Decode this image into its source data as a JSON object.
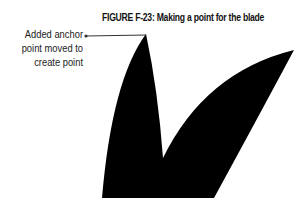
{
  "figure": {
    "label": "FIGURE F-23:",
    "title": "Making a point for the blade"
  },
  "callout": {
    "lines": [
      "Added anchor",
      "point moved to",
      "create point"
    ]
  },
  "colors": {
    "shape_fill": "#000000",
    "leader_line": "#333333",
    "text": "#222222"
  }
}
